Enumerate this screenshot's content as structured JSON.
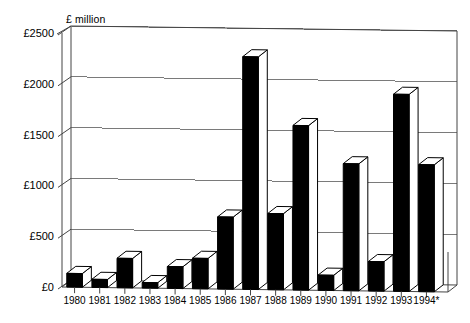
{
  "chart_data": {
    "type": "bar",
    "title": "",
    "subtitle": "",
    "axis_title": "£ million",
    "xlabel": "",
    "ylabel": "£ million",
    "categories": [
      "1980",
      "1981",
      "1982",
      "1983",
      "1984",
      "1985",
      "1986",
      "1987",
      "1988",
      "1989",
      "1990",
      "1991",
      "1992",
      "1993",
      "1994*"
    ],
    "values": [
      135,
      80,
      290,
      55,
      215,
      300,
      710,
      2290,
      750,
      1620,
      150,
      1250,
      290,
      1940,
      1250
    ],
    "series": [
      {
        "name": "£ million",
        "values": [
          135,
          80,
          290,
          55,
          215,
          300,
          710,
          2290,
          750,
          1620,
          150,
          1250,
          290,
          1940,
          1250
        ]
      }
    ],
    "ylim": [
      0,
      2500
    ],
    "yticks": [
      0,
      500,
      1000,
      1500,
      2000,
      2500
    ],
    "ytick_labels": [
      "£0",
      "£500",
      "£1000",
      "£1500",
      "£2000",
      "£2500"
    ],
    "grid": true,
    "grid_axis": "y",
    "legend": false,
    "legend_position": "none",
    "style": "3d-column",
    "annotations": [
      "* denotes provisional / estimated figure"
    ],
    "colors": {
      "bar_face": "#000000",
      "bar_top": "#ffffff",
      "bar_side": "#ffffff",
      "bar_outline": "#000000",
      "grid": "#7a7a7a",
      "axis": "#444444",
      "background": "#ffffff",
      "text": "#000000"
    }
  }
}
